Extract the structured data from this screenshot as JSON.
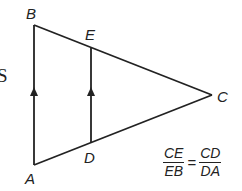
{
  "diagram": {
    "type": "triangle-with-parallel-segment",
    "stroke_color": "#222222",
    "vertices": {
      "A": {
        "x": 34,
        "y": 165
      },
      "B": {
        "x": 34,
        "y": 25
      },
      "C": {
        "x": 212,
        "y": 95
      },
      "D": {
        "x": 91,
        "y": 143
      },
      "E": {
        "x": 91,
        "y": 48
      }
    },
    "segments": [
      {
        "from": "A",
        "to": "B",
        "parallel_marker": "arrow-up"
      },
      {
        "from": "B",
        "to": "C"
      },
      {
        "from": "C",
        "to": "A"
      },
      {
        "from": "D",
        "to": "E",
        "parallel_marker": "arrow-up"
      }
    ],
    "labels": {
      "A": "A",
      "B": "B",
      "C": "C",
      "D": "D",
      "E": "E"
    },
    "cut_off_text": "S"
  },
  "equation": {
    "left": {
      "numerator": "CE",
      "denominator": "EB"
    },
    "operator": "=",
    "right": {
      "numerator": "CD",
      "denominator": "DA"
    }
  }
}
